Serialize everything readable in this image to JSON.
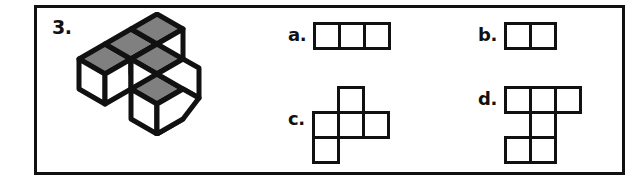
{
  "question": {
    "number_label": "3.",
    "frame_color": "#111111",
    "background": "#ffffff"
  },
  "stimulus": {
    "name": "isometric-cube-figure",
    "cube_count": 5,
    "top_face_color": "#808080",
    "side_face_color": "#ffffff",
    "outline_color": "#111111",
    "description": "five unit cubes drawn in isometric projection"
  },
  "options": [
    {
      "key": "a",
      "label": "a.",
      "cells": [
        [
          0,
          0
        ],
        [
          1,
          0
        ],
        [
          2,
          0
        ]
      ],
      "cols": 3,
      "rows": 1,
      "cell_size": 28,
      "cell_count": 3
    },
    {
      "key": "b",
      "label": "b.",
      "cells": [
        [
          0,
          0
        ],
        [
          1,
          0
        ]
      ],
      "cols": 2,
      "rows": 1,
      "cell_size": 28,
      "cell_count": 2
    },
    {
      "key": "c",
      "label": "c.",
      "cells": [
        [
          1,
          0
        ],
        [
          0,
          1
        ],
        [
          1,
          1
        ],
        [
          2,
          1
        ],
        [
          0,
          2
        ]
      ],
      "cols": 3,
      "rows": 3,
      "cell_size": 28,
      "cell_count": 5
    },
    {
      "key": "d",
      "label": "d.",
      "cells": [
        [
          0,
          0
        ],
        [
          1,
          0
        ],
        [
          2,
          0
        ],
        [
          1,
          1
        ],
        [
          0,
          2
        ],
        [
          1,
          2
        ]
      ],
      "cols": 3,
      "rows": 3,
      "cell_size": 28,
      "cell_count": 6
    }
  ]
}
